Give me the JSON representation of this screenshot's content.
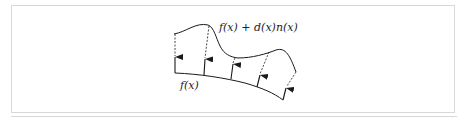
{
  "diagram": {
    "labels": {
      "displaced_surface": "f(x) + d(x)n(x)",
      "base_surface": "f(x)"
    },
    "colors": {
      "stroke": "#1a1a1a",
      "frame": "#d8d8d8"
    },
    "arrows_count": 5
  }
}
